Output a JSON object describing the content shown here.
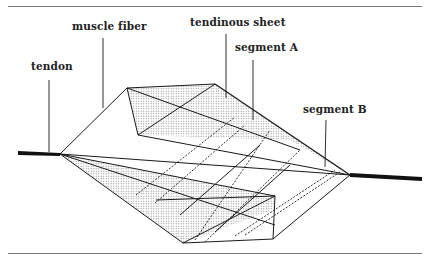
{
  "figure": {
    "labels": {
      "muscle_fiber": "muscle fiber",
      "tendinous_sheet": "tendinous sheet",
      "segment_a": "segment A",
      "segment_b": "segment B",
      "tendon": "tendon"
    },
    "colors": {
      "line": "#1a1a1a",
      "shade": "#c8c8c8",
      "rule": "#777777",
      "background": "#ffffff"
    }
  }
}
